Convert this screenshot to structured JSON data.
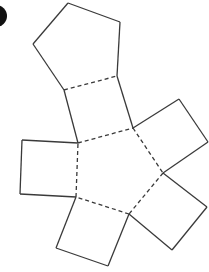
{
  "diagram": {
    "type": "net",
    "colors": {
      "stroke": "#3a3a3a",
      "marker": "#111111",
      "background": "#ffffff"
    },
    "faces": {
      "top_pentagon": [
        [
          68,
          3
        ],
        [
          120,
          22
        ],
        [
          117,
          76
        ],
        [
          64,
          90
        ],
        [
          33,
          44
        ]
      ],
      "top_square": [
        [
          64,
          90
        ],
        [
          117,
          76
        ],
        [
          133,
          128
        ],
        [
          78,
          143
        ]
      ],
      "center_pentagon": [
        [
          78,
          143
        ],
        [
          133,
          128
        ],
        [
          163,
          173
        ],
        [
          129,
          214
        ],
        [
          76,
          197
        ]
      ],
      "right_upper_square": [
        [
          133,
          128
        ],
        [
          179,
          99
        ],
        [
          208,
          142
        ],
        [
          163,
          173
        ]
      ],
      "right_lower_square": [
        [
          163,
          173
        ],
        [
          207,
          207
        ],
        [
          172,
          250
        ],
        [
          129,
          214
        ]
      ],
      "bottom_square": [
        [
          129,
          214
        ],
        [
          108,
          266
        ],
        [
          56,
          248
        ],
        [
          76,
          197
        ]
      ],
      "left_square": [
        [
          78,
          143
        ],
        [
          22,
          140
        ],
        [
          20,
          194
        ],
        [
          76,
          197
        ]
      ]
    },
    "fold_lines": [
      [
        [
          64,
          90
        ],
        [
          117,
          76
        ]
      ],
      [
        [
          78,
          143
        ],
        [
          133,
          128
        ]
      ],
      [
        [
          133,
          128
        ],
        [
          163,
          173
        ]
      ],
      [
        [
          163,
          173
        ],
        [
          129,
          214
        ]
      ],
      [
        [
          129,
          214
        ],
        [
          76,
          197
        ]
      ],
      [
        [
          76,
          197
        ],
        [
          78,
          143
        ]
      ]
    ],
    "label_marker": {
      "shape": "partial-circle",
      "cx": -4,
      "cy": 16,
      "r": 11
    }
  }
}
